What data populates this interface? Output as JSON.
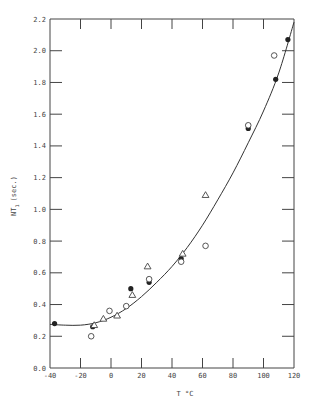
{
  "chart_data": {
    "type": "scatter",
    "title": "",
    "xlabel": "T °C",
    "ylabel": "NT1 (sec.)",
    "ylabel_main": "NT",
    "ylabel_sub": "1",
    "ylabel_unit": "(sec.)",
    "xlim": [
      -40,
      120
    ],
    "ylim": [
      0.0,
      2.2
    ],
    "x_ticks": [
      "-40",
      "-20",
      "0",
      "20",
      "40",
      "60",
      "80",
      "100",
      "120"
    ],
    "y_ticks": [
      "0.0",
      "0.2",
      "0.4",
      "0.6",
      "0.8",
      "1.0",
      "1.2",
      "1.4",
      "1.6",
      "1.8",
      "2.0",
      "2.2"
    ],
    "grid": false,
    "legend": null,
    "series": [
      {
        "name": "filled circles",
        "marker": "filled-circle",
        "points": [
          {
            "x": -37,
            "y": 0.28
          },
          {
            "x": -12,
            "y": 0.26
          },
          {
            "x": 13,
            "y": 0.5
          },
          {
            "x": 25,
            "y": 0.54
          },
          {
            "x": 46,
            "y": 0.69
          },
          {
            "x": 90,
            "y": 1.51
          },
          {
            "x": 90,
            "y": 1.53
          },
          {
            "x": 108,
            "y": 1.82
          },
          {
            "x": 116,
            "y": 2.07
          }
        ]
      },
      {
        "name": "open circles",
        "marker": "open-circle",
        "points": [
          {
            "x": -13,
            "y": 0.2
          },
          {
            "x": -1,
            "y": 0.36
          },
          {
            "x": 10,
            "y": 0.39
          },
          {
            "x": 25,
            "y": 0.56
          },
          {
            "x": 46,
            "y": 0.67
          },
          {
            "x": 62,
            "y": 0.77
          },
          {
            "x": 90,
            "y": 1.53
          },
          {
            "x": 107,
            "y": 1.97
          }
        ]
      },
      {
        "name": "open triangles",
        "marker": "open-triangle",
        "points": [
          {
            "x": -11,
            "y": 0.27
          },
          {
            "x": -5,
            "y": 0.31
          },
          {
            "x": 4,
            "y": 0.33
          },
          {
            "x": 14,
            "y": 0.46
          },
          {
            "x": 24,
            "y": 0.64
          },
          {
            "x": 47,
            "y": 0.72
          },
          {
            "x": 62,
            "y": 1.09
          }
        ]
      },
      {
        "name": "fitted curve",
        "marker": "line",
        "points": [
          {
            "x": -40,
            "y": 0.275
          },
          {
            "x": -30,
            "y": 0.27
          },
          {
            "x": -20,
            "y": 0.27
          },
          {
            "x": -10,
            "y": 0.285
          },
          {
            "x": 0,
            "y": 0.32
          },
          {
            "x": 10,
            "y": 0.375
          },
          {
            "x": 20,
            "y": 0.45
          },
          {
            "x": 30,
            "y": 0.54
          },
          {
            "x": 40,
            "y": 0.64
          },
          {
            "x": 50,
            "y": 0.76
          },
          {
            "x": 60,
            "y": 0.9
          },
          {
            "x": 70,
            "y": 1.06
          },
          {
            "x": 80,
            "y": 1.23
          },
          {
            "x": 90,
            "y": 1.42
          },
          {
            "x": 100,
            "y": 1.62
          },
          {
            "x": 110,
            "y": 1.86
          },
          {
            "x": 120,
            "y": 2.18
          }
        ]
      }
    ]
  }
}
